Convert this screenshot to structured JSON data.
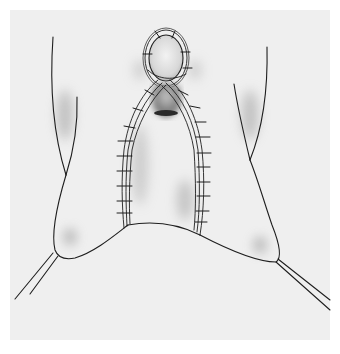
{
  "figure": {
    "kind": "surgical-illustration",
    "colors": {
      "page": "#ffffff",
      "panel": "#efefef",
      "ink": "#1e1e1e",
      "shade": "#9a9a9a",
      "dark_shade": "#3a3a3a"
    }
  }
}
